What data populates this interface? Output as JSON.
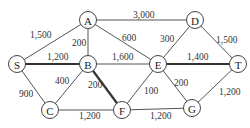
{
  "diagram": {
    "type": "weighted-graph",
    "nodes": [
      {
        "id": "A",
        "label": "A",
        "x": 88,
        "y": 20
      },
      {
        "id": "D",
        "label": "D",
        "x": 195,
        "y": 20
      },
      {
        "id": "S",
        "label": "S",
        "x": 17,
        "y": 64
      },
      {
        "id": "B",
        "label": "B",
        "x": 88,
        "y": 64
      },
      {
        "id": "E",
        "label": "E",
        "x": 158,
        "y": 64
      },
      {
        "id": "T",
        "label": "T",
        "x": 238,
        "y": 64
      },
      {
        "id": "C",
        "label": "C",
        "x": 50,
        "y": 110
      },
      {
        "id": "F",
        "label": "F",
        "x": 122,
        "y": 110
      },
      {
        "id": "G",
        "label": "G",
        "x": 192,
        "y": 108
      }
    ],
    "edges": [
      {
        "from": "S",
        "to": "A",
        "weight": "1,500",
        "thick": false,
        "lx": 30,
        "ly": 38
      },
      {
        "from": "A",
        "to": "D",
        "weight": "3,000",
        "thick": false,
        "lx": 133,
        "ly": 18
      },
      {
        "from": "A",
        "to": "B",
        "weight": "200",
        "thick": false,
        "lx": 72,
        "ly": 46
      },
      {
        "from": "A",
        "to": "E",
        "weight": "600",
        "thick": false,
        "lx": 122,
        "ly": 41
      },
      {
        "from": "D",
        "to": "E",
        "weight": "300",
        "thick": false,
        "lx": 160,
        "ly": 42
      },
      {
        "from": "D",
        "to": "T",
        "weight": "1,500",
        "thick": false,
        "lx": 216,
        "ly": 43
      },
      {
        "from": "S",
        "to": "B",
        "weight": "1,200",
        "thick": true,
        "lx": 47,
        "ly": 60
      },
      {
        "from": "B",
        "to": "E",
        "weight": "1,600",
        "thick": false,
        "lx": 112,
        "ly": 60
      },
      {
        "from": "E",
        "to": "T",
        "weight": "1,400",
        "thick": true,
        "lx": 187,
        "ly": 60
      },
      {
        "from": "S",
        "to": "C",
        "weight": "900",
        "thick": false,
        "lx": 19,
        "ly": 97
      },
      {
        "from": "B",
        "to": "C",
        "weight": "400",
        "thick": false,
        "lx": 55,
        "ly": 84
      },
      {
        "from": "B",
        "to": "F",
        "weight": "200",
        "thick": true,
        "lx": 88,
        "ly": 88
      },
      {
        "from": "E",
        "to": "F",
        "weight": "100",
        "thick": false,
        "lx": 144,
        "ly": 94
      },
      {
        "from": "E",
        "to": "G",
        "weight": "200",
        "thick": false,
        "lx": 174,
        "ly": 86
      },
      {
        "from": "C",
        "to": "F",
        "weight": "1,200",
        "thick": false,
        "lx": 79,
        "ly": 119
      },
      {
        "from": "F",
        "to": "G",
        "weight": "1,200",
        "thick": false,
        "lx": 150,
        "ly": 119
      },
      {
        "from": "G",
        "to": "T",
        "weight": "1,200",
        "thick": false,
        "lx": 219,
        "ly": 95
      }
    ]
  }
}
